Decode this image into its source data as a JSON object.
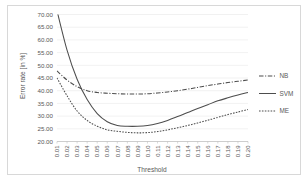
{
  "chart_data": {
    "type": "line",
    "title": "",
    "xlabel": "Threshold",
    "ylabel": "Error rate [in %]",
    "xlim": [
      0.01,
      0.2
    ],
    "ylim": [
      20.0,
      70.0
    ],
    "grid": true,
    "legend_position": "right",
    "categories": [
      "0.01",
      "0.02",
      "0.03",
      "0.04",
      "0.05",
      "0.06",
      "0.07",
      "0.08",
      "0.09",
      "0.10",
      "0.11",
      "0.12",
      "0.13",
      "0.14",
      "0.15",
      "0.16",
      "0.17",
      "0.18",
      "0.19",
      "0.20"
    ],
    "ytick_labels": [
      "70.00",
      "65.00",
      "60.00",
      "55.00",
      "50.00",
      "45.00",
      "40.00",
      "35.00",
      "30.00",
      "25.00",
      "20.00"
    ],
    "ytick_values": [
      70.0,
      65.0,
      60.0,
      55.0,
      50.0,
      45.0,
      40.0,
      35.0,
      30.0,
      25.0,
      20.0
    ],
    "series": [
      {
        "name": "NB",
        "style": "dash-dot",
        "color": "#4d4d4d",
        "values": [
          47.8,
          44.2,
          41.6,
          40.0,
          39.3,
          39.0,
          38.8,
          38.7,
          38.7,
          38.8,
          39.1,
          39.5,
          40.0,
          40.6,
          41.3,
          42.0,
          42.6,
          43.2,
          43.7,
          44.2
        ]
      },
      {
        "name": "SVM",
        "style": "solid",
        "color": "#4d4d4d",
        "values": [
          71.5,
          56.0,
          44.5,
          36.5,
          31.0,
          27.8,
          26.3,
          26.0,
          26.0,
          26.3,
          27.1,
          28.3,
          29.8,
          31.4,
          33.0,
          34.5,
          36.0,
          37.2,
          38.3,
          39.3
        ]
      },
      {
        "name": "ME",
        "style": "dotted",
        "color": "#4d4d4d",
        "values": [
          45.0,
          38.0,
          32.0,
          28.3,
          26.0,
          24.6,
          24.0,
          23.6,
          23.4,
          23.5,
          23.9,
          24.6,
          25.4,
          26.3,
          27.3,
          28.4,
          29.5,
          30.6,
          31.6,
          32.6
        ]
      }
    ]
  },
  "legend": {
    "items": [
      {
        "label": "NB"
      },
      {
        "label": "SVM"
      },
      {
        "label": "ME"
      }
    ]
  },
  "axes": {
    "x_title": "Threshold",
    "y_title": "Error rate [in %]"
  }
}
